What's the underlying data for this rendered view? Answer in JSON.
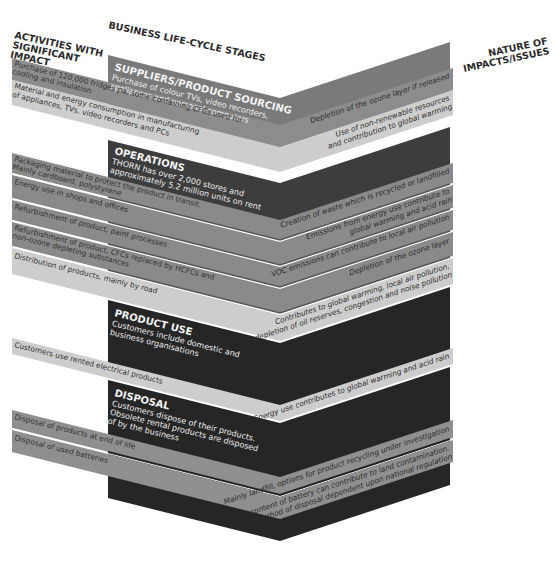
{
  "headers": {
    "activities": [
      "ACTIVITIES WITH",
      "SIGNIFICANT",
      "IMPACT"
    ],
    "stages": "BUSINESS LIFE-CYCLE STAGES",
    "impacts": [
      "NATURE OF",
      "IMPACTS/ISSUES"
    ]
  },
  "colors": {
    "dark": "#3a3a3a",
    "stage_dark": "#2e2e2e",
    "medium": "#8a8a8a",
    "light": "#c9c9c9",
    "separator": "#ffffff"
  },
  "stages": [
    {
      "title": "SUPPLIERS/PRODUCT SOURCING",
      "desc": [
        "Purchase of colour TVs, video recorders,",
        "appliances and personal computers"
      ]
    },
    {
      "title": "OPERATIONS",
      "desc": [
        "THORN has over 2,000 stores and",
        "approximately 5.2 million units on rent"
      ]
    },
    {
      "title": "PRODUCT USE",
      "desc": [
        "Customers include domestic and",
        "business organisations"
      ]
    },
    {
      "title": "DISPOSAL",
      "desc": [
        "Customers dispose of their products.",
        "Obsolete rental products are disposed",
        "of by the business"
      ]
    }
  ],
  "activities": [
    {
      "lines": [
        "Purchase of 120,000 fridges pa, some containing CFCs used for",
        "cooling and insulation"
      ],
      "impact": [
        "Depletion of the ozone layer if released"
      ]
    },
    {
      "lines": [
        "Material and energy consumption in manufacturing",
        "of appliances, TVs, video recorders and PCs"
      ],
      "impact": [
        "Use of non-renewable resources",
        "and contribution to global warming"
      ]
    },
    {
      "lines": [
        "Packaging material to protect the product in transit.",
        "Mainly cardboard, polystyrene"
      ],
      "impact": [
        "Creation of waste which is recycled or landfilled"
      ]
    },
    {
      "lines": [
        "Energy use in shops and offices"
      ],
      "impact": [
        "Emissions from energy use contribute to",
        "global warming and acid rain"
      ]
    },
    {
      "lines": [
        "Refurbishment of product, paint processes"
      ],
      "impact": [
        "VOC emissions can contribute to local air pollution"
      ]
    },
    {
      "lines": [
        "Refurbishment of product, CFCs replaced by HCFCs and",
        "non-ozone depleting substances"
      ],
      "impact": [
        "Depletion of the ozone layer"
      ]
    },
    {
      "lines": [
        "Distribution of products, mainly by road"
      ],
      "impact": [
        "Contributes to global warming, local air pollution,",
        "depletion of oil reserves, congestion and noise pollution"
      ]
    },
    {
      "lines": [
        "Customers use rented electrical products"
      ],
      "impact": [
        "Energy use contributes to global warming and acid rain"
      ]
    },
    {
      "lines": [
        "Disposal of products at end of life"
      ],
      "impact": [
        "Mainly landfill, options for product recycling under investigation"
      ]
    },
    {
      "lines": [
        "Disposal of used batteries"
      ],
      "impact": [
        "Metal content of battery can contribute to land contamination.",
        "Method of disposal dependent upon national regulation"
      ]
    }
  ]
}
